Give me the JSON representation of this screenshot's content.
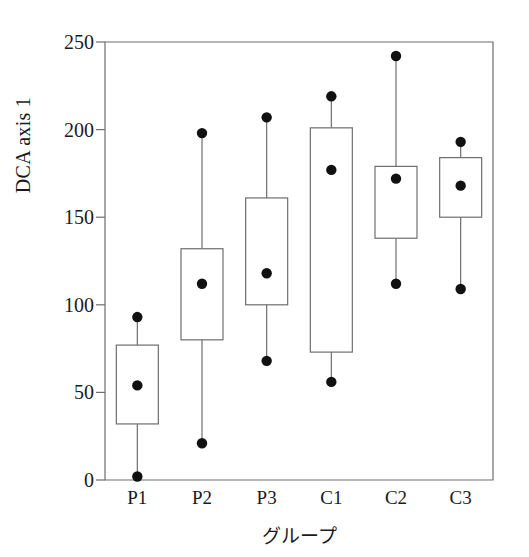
{
  "chart_data": {
    "type": "box",
    "title": "",
    "xlabel": "グループ",
    "ylabel": "DCA axis 1",
    "ylim": [
      0,
      250
    ],
    "yticks": [
      0,
      50,
      100,
      150,
      200,
      250
    ],
    "ytick_labels": [
      "0",
      "50",
      "100",
      "150",
      "200",
      "250"
    ],
    "grid": false,
    "legend": "none",
    "categories": [
      "P1",
      "P2",
      "P3",
      "C1",
      "C2",
      "C3"
    ],
    "marker": "filled-circle-mean",
    "boxes": [
      {
        "category": "P1",
        "whisker_low": 2,
        "box_low": 32,
        "mean": 54,
        "box_high": 77,
        "whisker_high": 93
      },
      {
        "category": "P2",
        "whisker_low": 21,
        "box_low": 80,
        "mean": 112,
        "box_high": 132,
        "whisker_high": 198
      },
      {
        "category": "P3",
        "whisker_low": 68,
        "box_low": 100,
        "mean": 118,
        "box_high": 161,
        "whisker_high": 207
      },
      {
        "category": "C1",
        "whisker_low": 56,
        "box_low": 73,
        "mean": 177,
        "box_high": 201,
        "whisker_high": 219
      },
      {
        "category": "C2",
        "whisker_low": 112,
        "box_low": 138,
        "mean": 172,
        "box_high": 179,
        "whisker_high": 242
      },
      {
        "category": "C3",
        "whisker_low": 109,
        "box_low": 150,
        "mean": 168,
        "box_high": 184,
        "whisker_high": 193
      }
    ],
    "colors": {
      "axis": "#6e6e6e",
      "box_stroke": "#6e6e6e",
      "whisker": "#6e6e6e",
      "marker": "#111111",
      "background": "#ffffff",
      "text": "#1a1a1a"
    }
  }
}
